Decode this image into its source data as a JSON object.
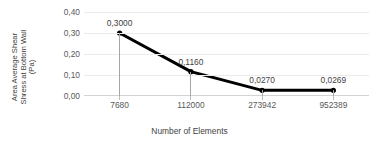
{
  "chart_data": {
    "type": "line",
    "title": "",
    "xlabel": "Number of Elements",
    "ylabel_lines": [
      "Area Average Shear",
      "Shress at Bottom Wall",
      "(Pa)"
    ],
    "categories": [
      "7680",
      "112000",
      "273942",
      "952389"
    ],
    "values": [
      0.3,
      0.116,
      0.027,
      0.0269
    ],
    "point_labels": [
      "0,3000",
      "0,1160",
      "0,0270",
      "0,0269"
    ],
    "ylim": [
      0.0,
      0.4
    ],
    "ytick_values": [
      0.0,
      0.1,
      0.2,
      0.3,
      0.4
    ],
    "ytick_labels": [
      "0,00",
      "0,10",
      "0,20",
      "0,30",
      "0,40"
    ],
    "decimal_separator": ",",
    "grid": "horizontal",
    "legend": "none",
    "series_color": "#000000",
    "gridline_color": "#ECEAEA",
    "dropline_color": "#A6A6A6",
    "axis_color": "#D4D2D2",
    "text_color": "#595959",
    "background": "#FFFFFF"
  }
}
